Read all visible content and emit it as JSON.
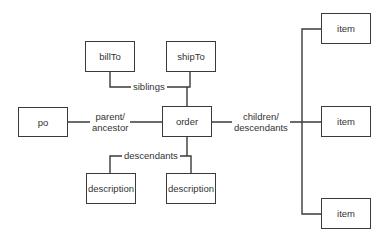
{
  "diagram": {
    "nodes": {
      "billTo": "billTo",
      "shipTo": "shipTo",
      "po": "po",
      "order": "order",
      "description_left": "description",
      "description_right": "description",
      "item_top": "item",
      "item_middle": "item",
      "item_bottom": "item"
    },
    "edges": {
      "siblings": "siblings",
      "parent_line1": "parent/",
      "parent_line2": "ancestor",
      "children_line1": "children/",
      "children_line2": "descendants",
      "descendants": "descendants"
    },
    "colors": {
      "stroke": "#3a3a3a",
      "text": "#333333",
      "background": "#ffffff"
    }
  }
}
